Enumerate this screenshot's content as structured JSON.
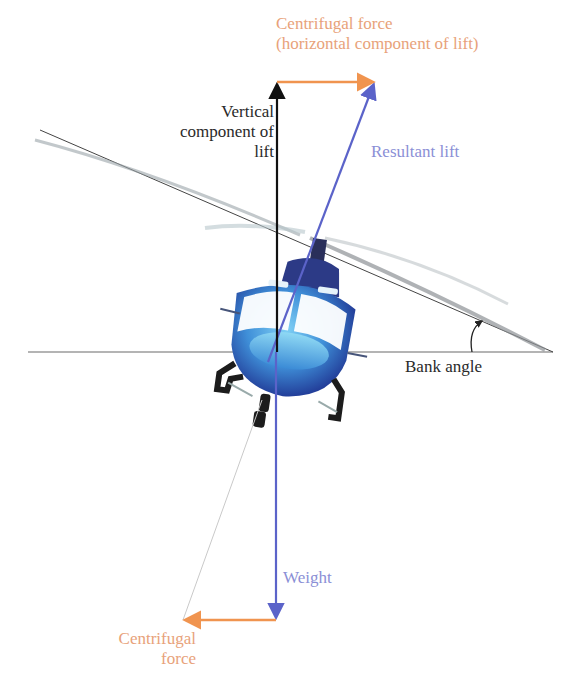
{
  "diagram": {
    "labels": {
      "centrifugal_top_line1": "Centrifugal force",
      "centrifugal_top_line2": "(horizontal component of lift)",
      "vertical_line1": "Vertical",
      "vertical_line2": "component of",
      "vertical_line3": "lift",
      "resultant": "Resultant lift",
      "bank_angle": "Bank angle",
      "weight": "Weight",
      "centrifugal_bottom_line1": "Centrifugal",
      "centrifugal_bottom_line2": "force"
    },
    "colors": {
      "centrifugal": "#f0944f",
      "centrifugal_text": "#e8a27a",
      "lift_weight": "#5b63c9",
      "lift_text": "#8b8fd6",
      "vertical": "#111111",
      "horizon": "#555555",
      "helicopter_body": "#3f8fd8"
    },
    "vectors": [
      {
        "name": "Vertical component of lift",
        "from": [
          277,
          352
        ],
        "to": [
          277,
          82
        ]
      },
      {
        "name": "Centrifugal force (horizontal component of lift)",
        "from": [
          277,
          82
        ],
        "to": [
          375,
          82
        ]
      },
      {
        "name": "Resultant lift",
        "from": [
          270,
          360
        ],
        "to": [
          375,
          82
        ]
      },
      {
        "name": "Weight",
        "from": [
          276,
          352
        ],
        "to": [
          276,
          620
        ]
      },
      {
        "name": "Centrifugal force",
        "from": [
          276,
          620
        ],
        "to": [
          183,
          620
        ]
      }
    ]
  }
}
